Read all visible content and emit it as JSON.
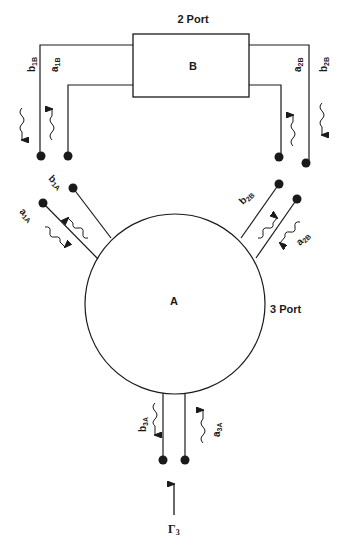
{
  "diagram": {
    "block_b": {
      "letter": "B",
      "type_label": "2 Port"
    },
    "block_a": {
      "letter": "A",
      "type_label": "3 Port"
    },
    "waves": {
      "b1B": {
        "main": "b",
        "sub": "1B"
      },
      "a1B": {
        "main": "a",
        "sub": "1B"
      },
      "a2B": {
        "main": "a",
        "sub": "2B"
      },
      "b2B": {
        "main": "b",
        "sub": "2B"
      },
      "b1A": {
        "main": "b",
        "sub": "1A"
      },
      "a1A": {
        "main": "a",
        "sub": "1A"
      },
      "b2A_printed": {
        "main": "b",
        "sub": "2B"
      },
      "a2A_printed": {
        "main": "a",
        "sub": "2B"
      },
      "b3A": {
        "main": "b",
        "sub": "3A"
      },
      "a3A": {
        "main": "a",
        "sub": "3A"
      }
    },
    "reflection": {
      "main": "Γ",
      "sub": "3"
    },
    "colors": {
      "ink": "#1a1a1a",
      "background": "#ffffff"
    }
  }
}
